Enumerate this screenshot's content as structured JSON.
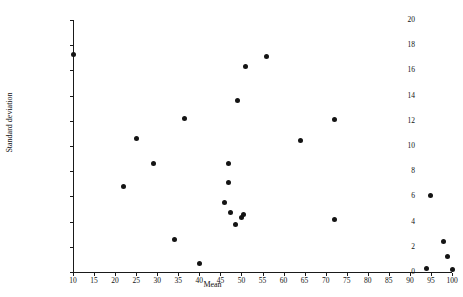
{
  "chart_data": {
    "type": "scatter",
    "title": "",
    "xlabel": "Mean",
    "ylabel": "Standard deviation",
    "xlim": [
      10,
      100
    ],
    "ylim": [
      0,
      20
    ],
    "xticks": [
      10,
      15,
      20,
      25,
      30,
      35,
      40,
      45,
      50,
      55,
      60,
      65,
      70,
      75,
      80,
      85,
      90,
      95,
      100
    ],
    "yticks": [
      0,
      2,
      4,
      6,
      8,
      10,
      12,
      14,
      16,
      18,
      20
    ],
    "grid": false,
    "legend": null,
    "marker_color": "#141414",
    "axis_color": "#1a1a1a",
    "points": [
      {
        "x": 10.0,
        "y": 17.3
      },
      {
        "x": 22.0,
        "y": 6.8
      },
      {
        "x": 25.0,
        "y": 10.6
      },
      {
        "x": 29.0,
        "y": 8.6
      },
      {
        "x": 34.0,
        "y": 2.6
      },
      {
        "x": 36.5,
        "y": 12.2
      },
      {
        "x": 40.0,
        "y": 0.7
      },
      {
        "x": 46.0,
        "y": 5.5
      },
      {
        "x": 47.0,
        "y": 8.6
      },
      {
        "x": 47.0,
        "y": 7.1
      },
      {
        "x": 47.5,
        "y": 4.7
      },
      {
        "x": 48.5,
        "y": 3.8
      },
      {
        "x": 49.0,
        "y": 13.6
      },
      {
        "x": 50.0,
        "y": 4.3
      },
      {
        "x": 50.6,
        "y": 4.6
      },
      {
        "x": 51.0,
        "y": 16.3
      },
      {
        "x": 56.0,
        "y": 17.1
      },
      {
        "x": 64.0,
        "y": 10.4
      },
      {
        "x": 72.0,
        "y": 12.1
      },
      {
        "x": 72.0,
        "y": 4.2
      },
      {
        "x": 94.0,
        "y": 0.3
      },
      {
        "x": 95.0,
        "y": 6.1
      },
      {
        "x": 98.0,
        "y": 2.4
      },
      {
        "x": 99.0,
        "y": 1.2
      },
      {
        "x": 100.0,
        "y": 0.2
      }
    ]
  }
}
